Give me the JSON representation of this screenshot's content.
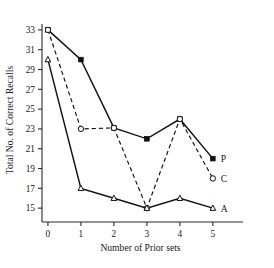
{
  "chart_data": {
    "type": "line",
    "title": "",
    "xlabel": "Number of Prior sets",
    "ylabel": "Total No. of Correct Recalls",
    "x": [
      0,
      1,
      2,
      3,
      4,
      5
    ],
    "xticklabels": [
      "0",
      "1",
      "2",
      "3",
      "4",
      "5"
    ],
    "yticks": [
      15,
      17,
      19,
      21,
      23,
      25,
      27,
      29,
      31,
      33
    ],
    "yticklabels": [
      "15",
      "17",
      "19",
      "21",
      "23",
      "25",
      "27",
      "29",
      "31",
      "33"
    ],
    "xlim": [
      -0.18,
      5.55
    ],
    "ylim": [
      13.6,
      34.2
    ],
    "grid": false,
    "legend_position": "right-of-line-ends",
    "series": [
      {
        "name": "P",
        "label": "P",
        "linestyle": "solid",
        "marker": "filled-square",
        "color": "#121212",
        "values": [
          33,
          30,
          23.1,
          22,
          24,
          20
        ]
      },
      {
        "name": "C",
        "label": "C",
        "linestyle": "dashed",
        "marker": "open-circle",
        "color": "#121212",
        "values": [
          33,
          23,
          23.1,
          15,
          24,
          18
        ]
      },
      {
        "name": "A",
        "label": "A",
        "linestyle": "solid",
        "marker": "open-triangle",
        "color": "#121212",
        "values": [
          30,
          17,
          16,
          15,
          16,
          15
        ]
      }
    ]
  },
  "axis": {
    "y_title": "Total No. of Correct Recalls",
    "x_title": "Number of Prior sets"
  }
}
